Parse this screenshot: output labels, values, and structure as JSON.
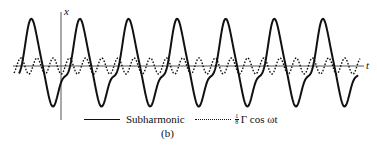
{
  "figure": {
    "panel_label": "(b)",
    "axes": {
      "horizontal_label": "t",
      "vertical_label": "x"
    },
    "legend": [
      {
        "style": "solid",
        "label": "Subharmonic"
      },
      {
        "style": "dotted",
        "label_fraction_numerator": "1",
        "label_fraction_denominator": "8",
        "label": "Γ cos ωt"
      }
    ],
    "colors": {
      "line": "#111111",
      "axis": "#555555",
      "background": "#ffffff"
    }
  },
  "chart_data": {
    "type": "line",
    "title": "",
    "xlabel": "t",
    "ylabel": "x",
    "grid": false,
    "legend_position": "bottom",
    "series": [
      {
        "name": "Subharmonic",
        "style": "solid",
        "relative_period": 3,
        "relative_amplitude": 1.0,
        "cycles_shown": 7
      },
      {
        "name": "(1/8) Γ cos ωt",
        "style": "dotted",
        "relative_period": 1,
        "relative_amplitude": 0.2,
        "cycles_shown": 21
      }
    ]
  }
}
